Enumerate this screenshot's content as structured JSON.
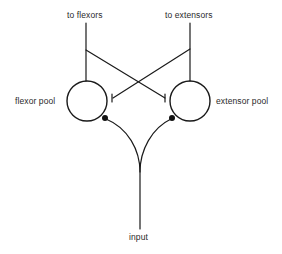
{
  "diagram": {
    "type": "neural-circuit",
    "labels": {
      "to_flexors": "to flexors",
      "to_extensors": "to extensors",
      "flexor_pool": "flexor pool",
      "extensor_pool": "extensor pool",
      "input": "input"
    },
    "nodes": [
      {
        "id": "flexor_pool",
        "label": "flexor pool",
        "shape": "circle"
      },
      {
        "id": "extensor_pool",
        "label": "extensor pool",
        "shape": "circle"
      }
    ],
    "connections": [
      {
        "from": "flexor_pool",
        "to": "to flexors",
        "type": "output"
      },
      {
        "from": "extensor_pool",
        "to": "to extensors",
        "type": "output"
      },
      {
        "from": "flexor_pool",
        "to": "extensor_pool",
        "type": "inhibitory"
      },
      {
        "from": "extensor_pool",
        "to": "flexor_pool",
        "type": "inhibitory"
      },
      {
        "from": "input",
        "to": "flexor_pool",
        "type": "excitatory"
      },
      {
        "from": "input",
        "to": "extensor_pool",
        "type": "excitatory"
      }
    ],
    "colors": {
      "line": "#1a1a1a",
      "text": "#2a2a2a",
      "background": "#ffffff"
    }
  }
}
